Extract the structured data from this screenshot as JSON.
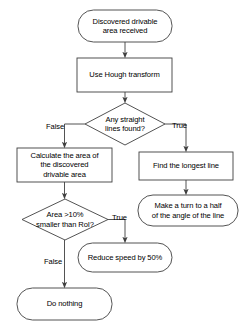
{
  "diagram": {
    "stroke_color": "#3f3f3f",
    "text_color": "#000000",
    "background_color": "#ffffff",
    "nodes": [
      {
        "id": "start",
        "shape": "terminator",
        "label": "Discovered drivable\narea received",
        "x": 78,
        "y": 10,
        "w": 94,
        "h": 32
      },
      {
        "id": "hough",
        "shape": "process",
        "label": "Use Hough transform",
        "x": 77,
        "y": 58,
        "w": 95,
        "h": 34
      },
      {
        "id": "lines-decision",
        "shape": "decision",
        "label": "Any straight\nlines found?",
        "x": 85,
        "y": 103,
        "w": 80,
        "h": 42
      },
      {
        "id": "calc-area",
        "shape": "process",
        "label": "Calculate the area of\nthe discovered\ndrivable area",
        "x": 17,
        "y": 148,
        "w": 95,
        "h": 34
      },
      {
        "id": "find-line",
        "shape": "process",
        "label": "Find the longest line",
        "x": 139,
        "y": 152,
        "w": 94,
        "h": 28
      },
      {
        "id": "make-turn",
        "shape": "terminator",
        "label": "Make a turn to a half\nof the angle of the line",
        "x": 138,
        "y": 195,
        "w": 100,
        "h": 31
      },
      {
        "id": "area-decision",
        "shape": "decision",
        "label": "Area >10%\nsmaller than RoI?",
        "x": 22,
        "y": 199,
        "w": 86,
        "h": 41
      },
      {
        "id": "reduce-speed",
        "shape": "terminator",
        "label": "Reduce speed by 50%",
        "x": 78,
        "y": 243,
        "w": 94,
        "h": 29
      },
      {
        "id": "do-nothing",
        "shape": "terminator",
        "label": "Do nothing",
        "x": 17,
        "y": 288,
        "w": 95,
        "h": 32
      }
    ],
    "edge_labels": [
      {
        "id": "lines-false",
        "text": "False",
        "x": 46,
        "y": 122
      },
      {
        "id": "lines-true",
        "text": "True",
        "x": 172,
        "y": 121
      },
      {
        "id": "area-true",
        "text": "True",
        "x": 112,
        "y": 213
      },
      {
        "id": "area-false",
        "text": "False",
        "x": 44,
        "y": 257
      }
    ]
  }
}
